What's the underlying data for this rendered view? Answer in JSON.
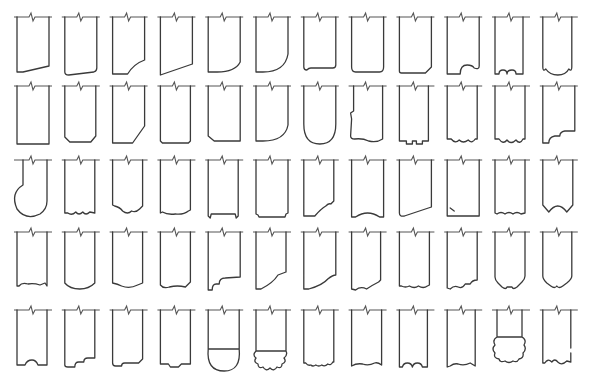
{
  "figure": {
    "rows": 5,
    "columns": 12,
    "stroke_color": "#3a3a3a",
    "background": "#ffffff",
    "layout": {
      "col_start_x": 14,
      "col_pitch": 47.8,
      "row_tops": [
        12,
        81,
        155,
        227,
        305
      ]
    }
  },
  "shapes": [
    [
      {
        "name": "slanted-bottom-notch",
        "d": "M3,5 L3,60 L9,60 L35,54 L35,5"
      },
      {
        "name": "slanted-bottom-rounded",
        "d": "M3,5 L3,60 Q3,63 7,63 L32,60 Q35,59 35,56 L35,5"
      },
      {
        "name": "cove-corner-right",
        "d": "M3,5 L3,62 L18,62 Q24,52 35,48 L35,5"
      },
      {
        "name": "diagonal-bottom",
        "d": "M3,5 L3,63 L35,52 L35,5"
      },
      {
        "name": "rounded-corner-right",
        "d": "M3,5 L3,60 L12,60 Q30,60 35,50 L35,5"
      },
      {
        "name": "quarter-round-right",
        "d": "M3,5 L3,60 L10,60 Q32,60 35,42 L35,5"
      },
      {
        "name": "notched-corners",
        "d": "M3,5 L3,55 Q3,58 6,58 Q8,56 10,56 L32,56 Q35,56 35,53 L35,5"
      },
      {
        "name": "rounded-corners-step",
        "d": "M3,5 L3,55 Q3,60 7,60 L31,60 Q35,60 35,55 L35,5"
      },
      {
        "name": "chamfer-corner-right",
        "d": "M3,5 L3,59 Q3,61 5,61 L29,61 L35,55 L35,5"
      },
      {
        "name": "ogee-cutout-right",
        "d": "M3,5 L3,62 L16,62 Q16,53 23,53 Q28,53 30,56 Q35,58 35,54 L35,5"
      },
      {
        "name": "double-cove-bottom",
        "d": "M3,5 L3,62 L7,62 Q7,58 11,58 Q15,58 15,62 Q15,58 20,58 Q24,58 24,62 L31,62 L31,5"
      },
      {
        "name": "center-bulge-bottom",
        "d": "M3,5 L3,55 Q3,60 6,57 Q10,63 18,63 Q26,63 29,57 Q32,60 32,55 L32,5"
      }
    ],
    [
      {
        "name": "plain-square",
        "d": "M3,5 L3,63 L35,63 L35,5"
      },
      {
        "name": "double-chamfer",
        "d": "M3,5 L3,56 L8,61 L29,61 L34,55 L34,5"
      },
      {
        "name": "long-chamfer-right",
        "d": "M3,5 L3,62 L23,62 L35,45 L35,5"
      },
      {
        "name": "square-small-notches",
        "d": "M3,5 L3,60 L5,62 L31,62 L33,60 L33,5"
      },
      {
        "name": "chamfer-left",
        "d": "M3,5 L3,55 L9,60 L35,60 L35,5"
      },
      {
        "name": "quarter-round-right-large",
        "d": "M3,5 L3,60 L10,60 Q32,60 35,44 L35,5"
      },
      {
        "name": "half-round-bottom",
        "d": "M3,5 L3,43 Q3,63 19,63 Q35,63 35,43 L35,5"
      },
      {
        "name": "irregular-scribed-edge",
        "d": "M5,5 L5,30 L2,32 L3,38 L2,55 Q2,58 6,58 Q14,57 20,60 Q28,62 34,58 L34,5"
      },
      {
        "name": "stepped-notch-bottom",
        "d": "M3,5 L3,60 L10,60 L10,63 L16,63 L16,60 L20,60 L20,63 L26,63 L26,60 L32,60 L32,5"
      },
      {
        "name": "double-bead-bottom",
        "d": "M3,5 L3,58 L7,58 Q11,63 15,59 Q19,63 24,59 Q28,63 31,58 L33,58 L33,5"
      },
      {
        "name": "double-cove-beads",
        "d": "M3,5 L3,58 L7,58 Q11,64 15,59 Q19,64 24,59 Q28,64 31,58 L33,58 L33,5"
      },
      {
        "name": "ogee-step-left",
        "d": "M3,5 L3,62 L9,62 Q9,56 15,55 L20,55 Q20,51 25,50 L35,50 L35,5"
      }
    ],
    [
      {
        "name": "bulb-round-left",
        "d": "M9,5 L9,30 Q-4,38 3,54 Q12,66 26,59 Q33,54 33,46 L33,5"
      },
      {
        "name": "triple-bead-bottom",
        "d": "M3,5 L3,58 L6,58 Q10,61 14,57 Q17,61 21,57 Q24,61 28,57 L33,58 L33,5"
      },
      {
        "name": "wave-bottom",
        "d": "M3,5 L3,50 L5,51 Q10,52 13,56 Q18,60 22,56 Q26,58 30,54 L33,51 L33,5"
      },
      {
        "name": "shallow-cove-bottom",
        "d": "M3,5 L3,58 L5,57 Q10,60 18,59 Q26,60 31,56 L33,55 L33,5"
      },
      {
        "name": "stepped-feet-bottom",
        "d": "M3,5 L3,61 L5,63 L6,59 L30,59 L31,63 L33,61 L33,5"
      },
      {
        "name": "small-rounded-feet",
        "d": "M3,5 L3,59 L5,60 L6,62 L32,62 L33,59 L35,58 L35,5"
      },
      {
        "name": "ogee-step-right",
        "d": "M3,5 L3,61 L14,61 Q20,54 25,51 Q28,48 30,49 L33,46 L33,5"
      },
      {
        "name": "broad-cove-bottom",
        "d": "M3,5 L3,62 L7,62 Q19,54 31,62 L35,62 L35,5"
      },
      {
        "name": "slanted-bottom-long",
        "d": "M3,5 L3,58 Q3,62 8,61 L35,52 L35,5"
      },
      {
        "name": "square-corner-mark",
        "d": "M3,5 L3,61 L35,61 L35,5 M6,53 L10,56"
      },
      {
        "name": "triple-wave-bottom",
        "d": "M3,5 L3,58 L5,59 Q9,56 13,59 Q17,56 21,59 Q25,56 29,59 L33,58 L33,5"
      },
      {
        "name": "center-arch-bottom",
        "d": "M3,5 L3,50 L9,57 Q18,45 27,57 L33,50 L33,5"
      }
    ],
    [
      {
        "name": "double-hump-bottom",
        "d": "M3,5 L3,59 L5,59 Q8,55 14,57 Q20,56 26,58 L31,56 L33,59 L33,5"
      },
      {
        "name": "cove-bottom-rounded",
        "d": "M3,5 L3,56 Q8,62 18,62 Q27,62 33,56 L33,5"
      },
      {
        "name": "offset-cove-bottom",
        "d": "M3,5 L3,56 Q8,57 12,59 Q20,62 28,58 L33,56 L33,5"
      },
      {
        "name": "ogee-shallow-bottom",
        "d": "M3,5 L3,58 Q6,62 12,60 Q20,58 28,60 L31,57 L33,55 L33,5"
      },
      {
        "name": "double-step-cove-left",
        "d": "M3,5 L3,63 L7,63 Q7,57 11,57 L14,57 Q14,51 20,51 L35,50 L35,5"
      },
      {
        "name": "long-ogee-right",
        "d": "M3,5 L3,62 L8,62 Q20,56 25,48 L33,45 L33,5"
      },
      {
        "name": "ogee-right-rounded",
        "d": "M3,5 L3,62 L8,62 Q22,58 27,52 Q32,48 35,48 L35,5"
      },
      {
        "name": "ogee-wave-right",
        "d": "M3,5 L3,62 L7,63 Q12,59 18,62 Q24,58 30,55 L32,53 L32,5"
      },
      {
        "name": "triple-wave-low",
        "d": "M3,5 L3,59 L5,59 Q9,61 13,59 Q18,62 22,59 Q27,62 31,59 L33,58 L33,5"
      },
      {
        "name": "stepped-wave-right",
        "d": "M3,5 L3,61 L6,62 Q10,58 14,60 Q18,62 21,57 L26,57 Q28,53 33,53 L33,5"
      },
      {
        "name": "tapered-foot-bottom",
        "d": "M3,5 L3,50 Q3,53 6,56 L10,60 Q14,63 15,60 L20,60 Q21,63 25,60 L30,55 Q33,52 33,49 L33,5"
      },
      {
        "name": "tapered-cove-foot",
        "d": "M3,5 L3,49 Q3,52 7,56 L11,59 Q15,62 17,59 Q19,62 23,59 L27,56 Q32,52 32,49 L32,5"
      }
    ],
    [
      {
        "name": "center-notch-bottom",
        "d": "M3,5 L3,60 L11,60 Q13,55 18,55 Q22,55 24,60 L33,60 L33,5"
      },
      {
        "name": "double-step-left",
        "d": "M3,5 L3,60 Q3,62 6,62 L13,62 Q13,57 17,57 L22,57 Q22,53 26,53 L33,53 L33,5"
      },
      {
        "name": "step-with-chamfer",
        "d": "M3,5 L3,58 Q3,61 6,61 L12,61 Q12,58 15,58 L29,58 L33,54 L33,5"
      },
      {
        "name": "center-flat-notch",
        "d": "M3,5 L3,59 L11,59 L13,62 L21,62 L24,59 L33,59 L33,5"
      },
      {
        "name": "half-round-with-line",
        "d": "M3,5 L3,44 L34,44 L34,5 M3,44 Q1,66 19,66 Q36,66 34,44"
      },
      {
        "name": "scalloped-half-round",
        "d": "M3,5 L3,46 L33,46 L33,5 M3,46 Q-1,50 3,53 Q0,57 5,59 Q5,64 10,62 Q13,67 17,63 Q21,67 24,62 Q29,64 29,59 Q34,57 31,53 Q35,50 33,46"
      },
      {
        "name": "scalloped-bottom-small",
        "d": "M3,5 L3,58 L5,58 Q7,61 10,60 Q12,62 15,60 Q18,62 21,60 Q24,62 27,59 Q30,61 32,57 L33,57 L33,5"
      },
      {
        "name": "shallow-wave-bottom-long",
        "d": "M3,5 L3,61 Q8,58 14,59 Q20,61 26,58 Q29,57 33,60 L33,5"
      },
      {
        "name": "double-arch-bottom",
        "d": "M3,5 L3,62 L6,62 Q7,58 11,58 Q15,58 16,62 Q17,58 21,58 Q25,58 26,62 L31,62 L31,5"
      },
      {
        "name": "wave-bottom-low",
        "d": "M3,5 L3,62 L6,61 Q10,58 14,59 Q20,61 26,58 L31,61 L31,5"
      },
      {
        "name": "scalloped-bulb",
        "d": "M5,5 L5,32 L30,32 L30,5 M5,32 Q0,35 3,40 Q-1,44 3,48 Q1,53 7,54 Q8,58 13,56 Q17,59 21,56 Q25,58 27,54 Q32,53 31,48 Q35,44 32,40 Q35,35 30,32"
      },
      {
        "name": "cove-bottom-stepped",
        "d": "M3,5 L3,58 L5,58 Q8,53 12,57 Q15,53 18,57 Q22,61 27,56 L31,57 L31,48 M31,43 L31,5"
      }
    ]
  ]
}
